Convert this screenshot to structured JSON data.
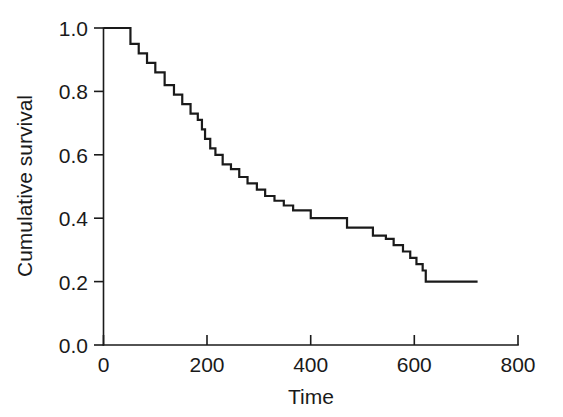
{
  "chart_data": {
    "type": "line",
    "subtype": "step-post",
    "title": "",
    "xlabel": "Time",
    "ylabel": "Cumulative survival",
    "xlim": [
      0,
      800
    ],
    "ylim": [
      0.0,
      1.0
    ],
    "xticks": [
      0,
      200,
      400,
      600,
      800
    ],
    "xtick_labels": [
      "0",
      "200",
      "400",
      "600",
      "800"
    ],
    "yticks": [
      0.0,
      0.2,
      0.4,
      0.6,
      0.8,
      1.0
    ],
    "ytick_labels": [
      "0.0",
      "0.2",
      "0.4",
      "0.6",
      "0.8",
      "1.0"
    ],
    "grid": false,
    "legend": false,
    "line_color": "#1a1a1a",
    "background_color": "#ffffff",
    "series": [
      {
        "name": "Cumulative survival",
        "x": [
          0,
          37,
          52,
          68,
          84,
          100,
          118,
          136,
          152,
          168,
          182,
          190,
          196,
          206,
          216,
          230,
          246,
          262,
          278,
          296,
          312,
          330,
          348,
          366,
          400,
          418,
          470,
          492,
          520,
          545,
          560,
          578,
          592,
          604,
          616,
          622,
          722
        ],
        "y": [
          1.0,
          1.0,
          0.95,
          0.92,
          0.89,
          0.86,
          0.82,
          0.79,
          0.76,
          0.73,
          0.71,
          0.68,
          0.65,
          0.62,
          0.6,
          0.57,
          0.555,
          0.53,
          0.51,
          0.49,
          0.47,
          0.455,
          0.44,
          0.425,
          0.4,
          0.4,
          0.37,
          0.37,
          0.345,
          0.335,
          0.315,
          0.295,
          0.275,
          0.255,
          0.235,
          0.2,
          0.2
        ],
        "n_steps": 28,
        "start_value": 1.0,
        "final_value": 0.2,
        "final_time": 722
      }
    ],
    "annotations": []
  },
  "axes": {
    "x_axis_name": "time-axis",
    "y_axis_name": "cumulative-survival-axis"
  }
}
